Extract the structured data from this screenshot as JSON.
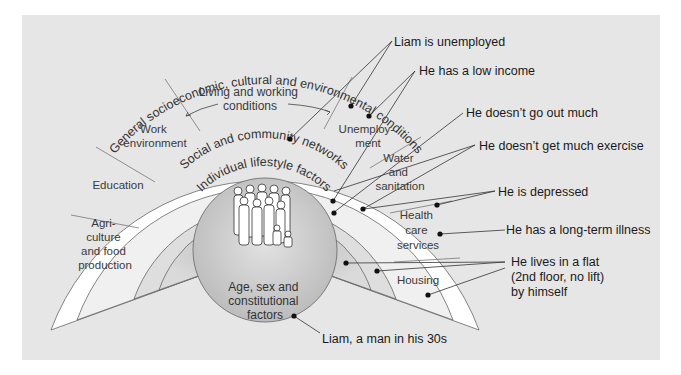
{
  "diagram": {
    "colors": {
      "background": "#e6e6e6",
      "outer_ring": "#ffffff",
      "living_ring": "#f1f1f1",
      "social_ring": "#dcdcdc",
      "lifestyle_ring": "#d2d2d2",
      "core": "#c6c6c6",
      "lines": "#555555"
    },
    "core": {
      "label_lines": [
        "Age, sex and",
        "constitutional",
        "factors"
      ],
      "icon": "people-group-icon"
    },
    "rings": {
      "lifestyle": "Individual lifestyle factors",
      "social": "Social and community networks",
      "outer": "General socioeconomic, cultural and environmental conditions"
    },
    "living_working": {
      "title_lines": [
        "Living and working",
        "conditions"
      ],
      "segments": [
        {
          "id": "agriculture",
          "lines": [
            "Agri-",
            "culture",
            "and food",
            "production"
          ]
        },
        {
          "id": "education",
          "lines": [
            "Education"
          ]
        },
        {
          "id": "work",
          "lines": [
            "Work",
            "environment"
          ]
        },
        {
          "id": "unemployment",
          "lines": [
            "Unemploy-",
            "ment"
          ]
        },
        {
          "id": "water",
          "lines": [
            "Water",
            "and",
            "sanitation"
          ]
        },
        {
          "id": "health",
          "lines": [
            "Health",
            "care",
            "services"
          ]
        },
        {
          "id": "housing",
          "lines": [
            "Housing"
          ]
        }
      ]
    },
    "callouts": [
      {
        "id": "unemployed",
        "text": "Liam is unemployed"
      },
      {
        "id": "low-income",
        "text": "He has a low income"
      },
      {
        "id": "go-out",
        "text": "He doesn’t go out much"
      },
      {
        "id": "exercise",
        "text": "He doesn’t get much exercise"
      },
      {
        "id": "depressed",
        "text": "He is depressed"
      },
      {
        "id": "illness",
        "text": "He has a long-term illness"
      },
      {
        "id": "flat",
        "lines": [
          "He lives in a flat",
          "(2nd floor, no lift)",
          "by himself"
        ]
      },
      {
        "id": "liam",
        "text": "Liam, a man in his 30s"
      }
    ]
  }
}
